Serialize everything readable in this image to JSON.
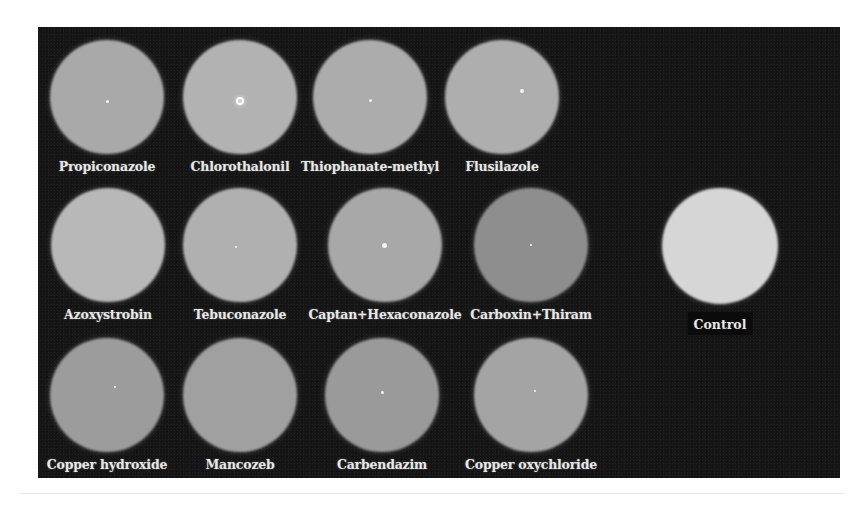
{
  "figure": {
    "panel_color": "#161616",
    "plates": [
      {
        "id": "propiconazole",
        "label": "Propiconazole",
        "cx": 107,
        "cy": 97,
        "r": 57,
        "tone": "#a9a9a9",
        "edge": "#8a8a8a",
        "dot": 3,
        "dot_dx": 0,
        "dot_dy": 4
      },
      {
        "id": "chlorothalonil",
        "label": "Chlorothalonil",
        "cx": 240,
        "cy": 97,
        "r": 57,
        "tone": "#b2b2b2",
        "edge": "#8f8f8f",
        "dot": 8,
        "dot_dx": 0,
        "dot_dy": 4,
        "dot_ring": true
      },
      {
        "id": "thiophanate-methyl",
        "label": "Thiophanate-methyl",
        "cx": 370,
        "cy": 97,
        "r": 57,
        "tone": "#acacac",
        "edge": "#8b8b8b",
        "dot": 3,
        "dot_dx": 0,
        "dot_dy": 3
      },
      {
        "id": "flusilazole",
        "label": "Flusilazole",
        "cx": 502,
        "cy": 97,
        "r": 57,
        "tone": "#aeaeae",
        "edge": "#8c8c8c",
        "dot": 4,
        "dot_dx": 20,
        "dot_dy": -6
      },
      {
        "id": "azoxystrobin",
        "label": "Azoxystrobin",
        "cx": 108,
        "cy": 245,
        "r": 57,
        "tone": "#b8b8b8",
        "edge": "#8e8e8e",
        "dot": 0,
        "dot_dx": 0,
        "dot_dy": 0
      },
      {
        "id": "tebuconazole",
        "label": "Tebuconazole",
        "cx": 240,
        "cy": 245,
        "r": 57,
        "tone": "#b0b0b0",
        "edge": "#8c8c8c",
        "dot": 2,
        "dot_dx": -4,
        "dot_dy": 2
      },
      {
        "id": "captan-hexaconazole",
        "label": "Captan+Hexaconazole",
        "cx": 385,
        "cy": 245,
        "r": 57,
        "tone": "#a8a8a8",
        "edge": "#888888",
        "dot": 5,
        "dot_dx": -1,
        "dot_dy": 0
      },
      {
        "id": "carboxin-thiram",
        "label": "Carboxin+Thiram",
        "cx": 531,
        "cy": 245,
        "r": 57,
        "tone": "#8e8e8e",
        "edge": "#747474",
        "dot": 2,
        "dot_dx": 0,
        "dot_dy": 0
      },
      {
        "id": "control",
        "label": "Control",
        "cx": 720,
        "cy": 246,
        "r": 58,
        "tone": "#d6d6d6",
        "edge": "#a6a6a6",
        "dot": 0,
        "dot_dx": 0,
        "dot_dy": 0
      },
      {
        "id": "copper-hydroxide",
        "label": "Copper hydroxide",
        "cx": 107,
        "cy": 395,
        "r": 57,
        "tone": "#9c9c9c",
        "edge": "#7c7c7c",
        "dot": 2,
        "dot_dx": 8,
        "dot_dy": -8
      },
      {
        "id": "mancozeb",
        "label": "Mancozeb",
        "cx": 240,
        "cy": 395,
        "r": 57,
        "tone": "#a0a0a0",
        "edge": "#808080",
        "dot": 0,
        "dot_dx": 0,
        "dot_dy": 0
      },
      {
        "id": "carbendazim",
        "label": "Carbendazim",
        "cx": 382,
        "cy": 395,
        "r": 57,
        "tone": "#9a9a9a",
        "edge": "#7a7a7a",
        "dot": 3,
        "dot_dx": 0,
        "dot_dy": -3
      },
      {
        "id": "copper-oxychloride",
        "label": "Copper oxychloride",
        "cx": 531,
        "cy": 395,
        "r": 57,
        "tone": "#a4a4a4",
        "edge": "#838383",
        "dot": 2,
        "dot_dx": 4,
        "dot_dy": -4
      }
    ],
    "label_offset_y": 70
  }
}
